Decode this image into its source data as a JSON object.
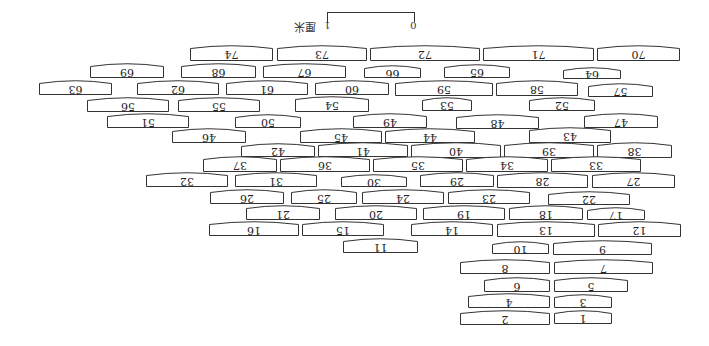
{
  "figure": {
    "orientation": "rotated-180",
    "stroke_color": "#333333",
    "fill_color": "#ffffff"
  },
  "scale_bar": {
    "start_label": "0",
    "end_label": "1",
    "unit_label": "厘米"
  },
  "tiles": [
    {
      "label": "74",
      "x": 190,
      "y": 48,
      "w": 83,
      "h": 13
    },
    {
      "label": "73",
      "x": 277,
      "y": 48,
      "w": 90,
      "h": 13
    },
    {
      "label": "72",
      "x": 370,
      "y": 48,
      "w": 110,
      "h": 13
    },
    {
      "label": "71",
      "x": 483,
      "y": 48,
      "w": 111,
      "h": 13
    },
    {
      "label": "70",
      "x": 597,
      "y": 48,
      "w": 83,
      "h": 13
    },
    {
      "label": "69",
      "x": 90,
      "y": 66,
      "w": 74,
      "h": 12
    },
    {
      "label": "68",
      "x": 181,
      "y": 66,
      "w": 75,
      "h": 12
    },
    {
      "label": "67",
      "x": 263,
      "y": 66,
      "w": 83,
      "h": 12
    },
    {
      "label": "66",
      "x": 364,
      "y": 68,
      "w": 57,
      "h": 10
    },
    {
      "label": "65",
      "x": 444,
      "y": 67,
      "w": 66,
      "h": 11
    },
    {
      "label": "64",
      "x": 563,
      "y": 70,
      "w": 58,
      "h": 9
    },
    {
      "label": "63",
      "x": 39,
      "y": 83,
      "w": 73,
      "h": 12
    },
    {
      "label": "62",
      "x": 137,
      "y": 83,
      "w": 82,
      "h": 12
    },
    {
      "label": "61",
      "x": 226,
      "y": 83,
      "w": 82,
      "h": 12
    },
    {
      "label": "60",
      "x": 315,
      "y": 83,
      "w": 74,
      "h": 12
    },
    {
      "label": "59",
      "x": 395,
      "y": 83,
      "w": 98,
      "h": 13
    },
    {
      "label": "58",
      "x": 496,
      "y": 83,
      "w": 82,
      "h": 13
    },
    {
      "label": "57",
      "x": 588,
      "y": 86,
      "w": 65,
      "h": 11
    },
    {
      "label": "56",
      "x": 87,
      "y": 100,
      "w": 82,
      "h": 12
    },
    {
      "label": "55",
      "x": 178,
      "y": 100,
      "w": 82,
      "h": 12
    },
    {
      "label": "54",
      "x": 295,
      "y": 99,
      "w": 74,
      "h": 13
    },
    {
      "label": "53",
      "x": 422,
      "y": 100,
      "w": 50,
      "h": 11
    },
    {
      "label": "52",
      "x": 529,
      "y": 100,
      "w": 66,
      "h": 11
    },
    {
      "label": "51",
      "x": 107,
      "y": 116,
      "w": 82,
      "h": 12
    },
    {
      "label": "50",
      "x": 235,
      "y": 117,
      "w": 66,
      "h": 11
    },
    {
      "label": "49",
      "x": 353,
      "y": 116,
      "w": 74,
      "h": 12
    },
    {
      "label": "48",
      "x": 456,
      "y": 117,
      "w": 83,
      "h": 12
    },
    {
      "label": "47",
      "x": 584,
      "y": 116,
      "w": 74,
      "h": 12
    },
    {
      "label": "46",
      "x": 172,
      "y": 131,
      "w": 74,
      "h": 12
    },
    {
      "label": "45",
      "x": 300,
      "y": 131,
      "w": 82,
      "h": 12
    },
    {
      "label": "44",
      "x": 385,
      "y": 131,
      "w": 90,
      "h": 12
    },
    {
      "label": "43",
      "x": 529,
      "y": 130,
      "w": 82,
      "h": 13
    },
    {
      "label": "42",
      "x": 241,
      "y": 146,
      "w": 74,
      "h": 11
    },
    {
      "label": "41",
      "x": 318,
      "y": 145,
      "w": 90,
      "h": 12
    },
    {
      "label": "40",
      "x": 411,
      "y": 145,
      "w": 90,
      "h": 13
    },
    {
      "label": "39",
      "x": 504,
      "y": 145,
      "w": 90,
      "h": 13
    },
    {
      "label": "38",
      "x": 597,
      "y": 145,
      "w": 75,
      "h": 13
    },
    {
      "label": "37",
      "x": 203,
      "y": 159,
      "w": 74,
      "h": 13
    },
    {
      "label": "36",
      "x": 280,
      "y": 159,
      "w": 90,
      "h": 13
    },
    {
      "label": "35",
      "x": 373,
      "y": 159,
      "w": 90,
      "h": 13
    },
    {
      "label": "34",
      "x": 466,
      "y": 159,
      "w": 82,
      "h": 13
    },
    {
      "label": "33",
      "x": 551,
      "y": 159,
      "w": 90,
      "h": 13
    },
    {
      "label": "32",
      "x": 146,
      "y": 175,
      "w": 82,
      "h": 12
    },
    {
      "label": "31",
      "x": 235,
      "y": 175,
      "w": 82,
      "h": 12
    },
    {
      "label": "30",
      "x": 341,
      "y": 177,
      "w": 66,
      "h": 10
    },
    {
      "label": "29",
      "x": 420,
      "y": 175,
      "w": 74,
      "h": 12
    },
    {
      "label": "28",
      "x": 497,
      "y": 175,
      "w": 91,
      "h": 13
    },
    {
      "label": "27",
      "x": 592,
      "y": 175,
      "w": 83,
      "h": 13
    },
    {
      "label": "26",
      "x": 210,
      "y": 192,
      "w": 74,
      "h": 12
    },
    {
      "label": "25",
      "x": 291,
      "y": 192,
      "w": 66,
      "h": 12
    },
    {
      "label": "24",
      "x": 362,
      "y": 192,
      "w": 82,
      "h": 12
    },
    {
      "label": "23",
      "x": 448,
      "y": 192,
      "w": 82,
      "h": 12
    },
    {
      "label": "22",
      "x": 548,
      "y": 194,
      "w": 82,
      "h": 11
    },
    {
      "label": "21",
      "x": 246,
      "y": 208,
      "w": 74,
      "h": 12
    },
    {
      "label": "20",
      "x": 335,
      "y": 208,
      "w": 82,
      "h": 12
    },
    {
      "label": "19",
      "x": 423,
      "y": 208,
      "w": 82,
      "h": 12
    },
    {
      "label": "18",
      "x": 509,
      "y": 208,
      "w": 74,
      "h": 12
    },
    {
      "label": "17",
      "x": 587,
      "y": 210,
      "w": 58,
      "h": 10
    },
    {
      "label": "16",
      "x": 209,
      "y": 224,
      "w": 90,
      "h": 12
    },
    {
      "label": "15",
      "x": 302,
      "y": 224,
      "w": 82,
      "h": 12
    },
    {
      "label": "14",
      "x": 411,
      "y": 224,
      "w": 82,
      "h": 12
    },
    {
      "label": "13",
      "x": 497,
      "y": 224,
      "w": 98,
      "h": 13
    },
    {
      "label": "12",
      "x": 598,
      "y": 224,
      "w": 83,
      "h": 13
    },
    {
      "label": "11",
      "x": 343,
      "y": 241,
      "w": 75,
      "h": 12
    },
    {
      "label": "10",
      "x": 492,
      "y": 244,
      "w": 57,
      "h": 10
    },
    {
      "label": "9",
      "x": 553,
      "y": 243,
      "w": 99,
      "h": 12
    },
    {
      "label": "8",
      "x": 460,
      "y": 262,
      "w": 90,
      "h": 12
    },
    {
      "label": "7",
      "x": 554,
      "y": 262,
      "w": 99,
      "h": 12
    },
    {
      "label": "6",
      "x": 484,
      "y": 280,
      "w": 66,
      "h": 12
    },
    {
      "label": "5",
      "x": 554,
      "y": 280,
      "w": 74,
      "h": 12
    },
    {
      "label": "4",
      "x": 468,
      "y": 296,
      "w": 82,
      "h": 12
    },
    {
      "label": "3",
      "x": 554,
      "y": 297,
      "w": 58,
      "h": 11
    },
    {
      "label": "2",
      "x": 460,
      "y": 313,
      "w": 90,
      "h": 12
    },
    {
      "label": "1",
      "x": 554,
      "y": 313,
      "w": 58,
      "h": 11
    }
  ]
}
